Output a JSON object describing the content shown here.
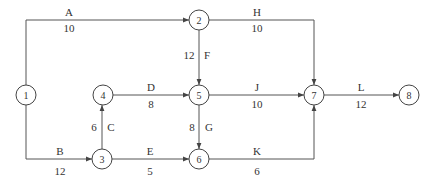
{
  "diagram": {
    "type": "activity-on-arrow network",
    "nodes": [
      {
        "id": "1",
        "label": "1",
        "x": 26,
        "y": 95
      },
      {
        "id": "2",
        "label": "2",
        "x": 199,
        "y": 20
      },
      {
        "id": "3",
        "label": "3",
        "x": 102,
        "y": 159
      },
      {
        "id": "4",
        "label": "4",
        "x": 103,
        "y": 95
      },
      {
        "id": "5",
        "label": "5",
        "x": 199,
        "y": 95
      },
      {
        "id": "6",
        "label": "6",
        "x": 199,
        "y": 159
      },
      {
        "id": "7",
        "label": "7",
        "x": 314,
        "y": 95
      },
      {
        "id": "8",
        "label": "8",
        "x": 409,
        "y": 95
      }
    ],
    "edges": [
      {
        "activity": "A",
        "duration": "10",
        "from": "1",
        "to": "2"
      },
      {
        "activity": "B",
        "duration": "12",
        "from": "1",
        "to": "3"
      },
      {
        "activity": "C",
        "duration": "6",
        "from": "3",
        "to": "4"
      },
      {
        "activity": "D",
        "duration": "8",
        "from": "4",
        "to": "5"
      },
      {
        "activity": "E",
        "duration": "5",
        "from": "3",
        "to": "6"
      },
      {
        "activity": "F",
        "duration": "12",
        "from": "2",
        "to": "5"
      },
      {
        "activity": "G",
        "duration": "8",
        "from": "5",
        "to": "6"
      },
      {
        "activity": "H",
        "duration": "10",
        "from": "2",
        "to": "7"
      },
      {
        "activity": "J",
        "duration": "10",
        "from": "5",
        "to": "7"
      },
      {
        "activity": "K",
        "duration": "6",
        "from": "6",
        "to": "7"
      },
      {
        "activity": "L",
        "duration": "12",
        "from": "7",
        "to": "8"
      }
    ]
  }
}
